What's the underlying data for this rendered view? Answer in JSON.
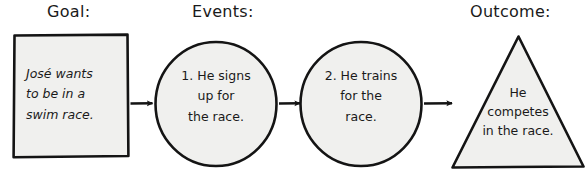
{
  "diagram": {
    "title_row": {
      "goal_label": "Goal:",
      "events_label": "Events:",
      "outcome_label": "Outcome:"
    },
    "nodes": {
      "goal": {
        "shape": "rectangle",
        "text": "José wants\nto be in a\nswim race."
      },
      "event_1": {
        "shape": "circle",
        "text": "1. He signs\nup for\nthe race."
      },
      "event_2": {
        "shape": "circle",
        "text": "2. He trains\nfor the\nrace."
      },
      "outcome": {
        "shape": "triangle",
        "text": "He\ncompetes\nin the race."
      }
    },
    "connectors": [
      {
        "name": "arrow-goal-to-event1",
        "icon": "arrow-right-icon"
      },
      {
        "name": "arrow-event1-to-event2",
        "icon": "arrow-right-icon"
      },
      {
        "name": "arrow-event2-to-outcome",
        "icon": "arrow-right-icon"
      }
    ],
    "colors": {
      "ink": "#1a1a1a",
      "shape_fill": "#f0f0ee",
      "background": "#ffffff"
    }
  }
}
